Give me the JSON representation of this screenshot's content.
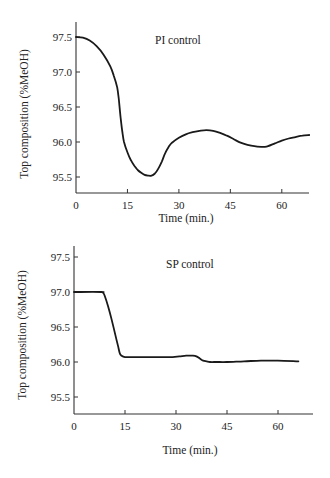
{
  "chart_data": [
    {
      "type": "line",
      "title": "PI control",
      "xlabel": "Time (min.)",
      "ylabel": "Top composition (%MeOH)",
      "xlim": [
        0,
        68
      ],
      "ylim": [
        95.3,
        97.7
      ],
      "xticks": [
        0,
        15,
        30,
        45,
        60
      ],
      "xtick_labels": [
        "0",
        "15",
        "30",
        "45",
        "60"
      ],
      "yticks": [
        95.5,
        96.0,
        96.5,
        97.0,
        97.5
      ],
      "ytick_labels": [
        "95.5",
        "96.0",
        "96.5",
        "97.0",
        "97.5"
      ],
      "grid": false,
      "legend": null,
      "series": [
        {
          "name": "PI control",
          "x": [
            0,
            2,
            4,
            6,
            8,
            10,
            11,
            12,
            12.5,
            13,
            13.5,
            14,
            15,
            16,
            17,
            18,
            19,
            20,
            21,
            22,
            23,
            24,
            25,
            26,
            27,
            28,
            30,
            32,
            34,
            36,
            38,
            40,
            42,
            44,
            46,
            48,
            50,
            52,
            54,
            55,
            56,
            58,
            60,
            62,
            64,
            66,
            68
          ],
          "y": [
            97.5,
            97.49,
            97.45,
            97.37,
            97.25,
            97.08,
            96.95,
            96.78,
            96.6,
            96.35,
            96.15,
            96.0,
            95.85,
            95.74,
            95.66,
            95.6,
            95.56,
            95.53,
            95.52,
            95.52,
            95.55,
            95.62,
            95.72,
            95.84,
            95.93,
            95.99,
            96.06,
            96.11,
            96.14,
            96.16,
            96.17,
            96.16,
            96.13,
            96.09,
            96.04,
            95.99,
            95.96,
            95.94,
            95.93,
            95.93,
            95.94,
            95.98,
            96.02,
            96.05,
            96.07,
            96.09,
            96.1
          ]
        }
      ]
    },
    {
      "type": "line",
      "title": "SP control",
      "xlabel": "Time (min.)",
      "ylabel": "Top composition (%MeOH)",
      "xlim": [
        0,
        70
      ],
      "ylim": [
        95.3,
        97.7
      ],
      "xticks": [
        0,
        15,
        30,
        45,
        60
      ],
      "xtick_labels": [
        "0",
        "15",
        "30",
        "45",
        "60"
      ],
      "yticks": [
        95.5,
        96.0,
        96.5,
        97.0,
        97.5
      ],
      "ytick_labels": [
        "95.5",
        "96.0",
        "96.5",
        "97.0",
        "97.5"
      ],
      "grid": false,
      "legend": null,
      "series": [
        {
          "name": "SP control",
          "x": [
            0,
            8,
            8.5,
            9,
            10,
            11,
            12,
            13,
            13.5,
            14,
            15,
            17,
            20,
            25,
            29,
            31,
            33,
            35,
            36,
            37,
            38,
            39,
            40,
            42,
            45,
            50,
            55,
            60,
            66
          ],
          "y": [
            97.0,
            97.0,
            96.99,
            96.95,
            96.8,
            96.62,
            96.42,
            96.22,
            96.12,
            96.09,
            96.07,
            96.07,
            96.07,
            96.07,
            96.07,
            96.08,
            96.09,
            96.09,
            96.08,
            96.05,
            96.02,
            96.01,
            96.0,
            96.0,
            96.0,
            96.01,
            96.02,
            96.02,
            96.01
          ]
        }
      ]
    }
  ],
  "charts": [
    {
      "title": "PI control",
      "xlabel": "Time (min.)",
      "ylabel": "Top composition (%MeOH)"
    },
    {
      "title": "SP control",
      "xlabel": "Time (min.)",
      "ylabel": "Top composition (%MeOH)"
    }
  ]
}
